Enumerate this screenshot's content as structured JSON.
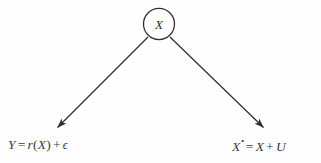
{
  "diagram": {
    "type": "causal-diagram",
    "background_color": "#fefefe",
    "stroke_color": "#2f2f2f",
    "text_color": "#3a3a3a",
    "nodes": [
      {
        "id": "x-node",
        "label": "X",
        "shape": "circle",
        "cx": 159,
        "cy": 24,
        "r": 15.5,
        "fill": "#ffffff",
        "stroke": "#2f2f2f"
      }
    ],
    "edges": [
      {
        "id": "edge-x-to-y",
        "from": "x-node",
        "to": "eq-left",
        "arrowhead": "filled-triangle",
        "x1": 148,
        "y1": 37,
        "x2": 56,
        "y2": 129
      },
      {
        "id": "edge-x-to-xstar",
        "from": "x-node",
        "to": "eq-right",
        "arrowhead": "filled-triangle",
        "x1": 170,
        "y1": 37,
        "x2": 265,
        "y2": 129
      }
    ],
    "labels": {
      "left_equation": {
        "id": "eq-left",
        "full_text": "Y = r(X) + ϵ",
        "lhs": "Y",
        "equals": "=",
        "fn_name": "r",
        "open_paren": "(",
        "fn_arg": "X",
        "close_paren": ")",
        "plus": "+",
        "error_term": "ϵ"
      },
      "right_equation": {
        "id": "eq-right",
        "full_text": "X• = X + U",
        "lhs_var": "X",
        "lhs_superscript": "•",
        "equals": "=",
        "rhs_var": "X",
        "plus": "+",
        "error_term": "U"
      }
    }
  }
}
